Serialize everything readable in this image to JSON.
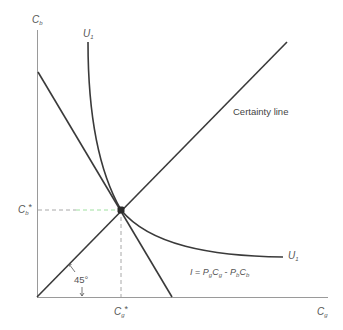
{
  "diagram": {
    "type": "indifference-curve-diagram",
    "axes": {
      "y_label": "C",
      "y_label_sub": "b",
      "x_label": "C",
      "x_label_sub": "g"
    },
    "curves": {
      "indifference_label_top": "U",
      "indifference_label_top_sub": "1",
      "indifference_label_right": "U",
      "indifference_label_right_sub": "1",
      "certainty_line_label": "Certainty line"
    },
    "budget_constraint": {
      "lhs": "I",
      "eq": "=",
      "t1_p": "P",
      "t1_p_sub": "g",
      "t1_c": "C",
      "t1_c_sub": "g",
      "op": "-",
      "t2_p": "P",
      "t2_p_sub": "b",
      "t2_c": "C",
      "t2_c_sub": "b"
    },
    "equilibrium": {
      "cb_star": "C",
      "cb_star_sub": "b",
      "cg_star": "C",
      "cg_star_sub": "g",
      "star": "*"
    },
    "angle_label": "45°",
    "colors": {
      "line": "#3a3a3a",
      "axis": "#9a9a9a",
      "dash": "#a8a8a8",
      "dash_accent": "#9fe0a0",
      "text": "#555555"
    }
  }
}
